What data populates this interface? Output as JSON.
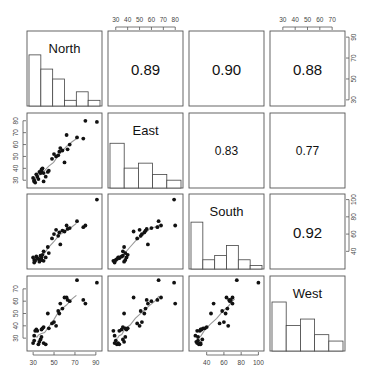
{
  "chart_data": {
    "type": "scatter",
    "title": "",
    "subtitle": "Scatterplot matrix (pairs plot) with histograms on diagonal, LOWESS smoothers in lower panels, correlation coefficients in upper panels",
    "variables": [
      "North",
      "East",
      "South",
      "West"
    ],
    "axis_ticks": {
      "North": [
        30,
        50,
        70,
        90
      ],
      "East": [
        30,
        40,
        50,
        60,
        70,
        80
      ],
      "South": [
        40,
        60,
        80,
        100
      ],
      "West": [
        30,
        40,
        50,
        60,
        70
      ]
    },
    "axis_ranges": {
      "North": [
        27,
        93
      ],
      "East": [
        26,
        84
      ],
      "South": [
        23,
        103
      ],
      "West": [
        22,
        78
      ]
    },
    "correlations": [
      {
        "pair": [
          "North",
          "East"
        ],
        "r": "0.89"
      },
      {
        "pair": [
          "North",
          "South"
        ],
        "r": "0.90"
      },
      {
        "pair": [
          "North",
          "West"
        ],
        "r": "0.88"
      },
      {
        "pair": [
          "East",
          "South"
        ],
        "r": "0.83"
      },
      {
        "pair": [
          "East",
          "West"
        ],
        "r": "0.77"
      },
      {
        "pair": [
          "South",
          "West"
        ],
        "r": "0.92"
      }
    ],
    "histograms": {
      "North": [
        0.72,
        0.52,
        0.38,
        0.08,
        0.2,
        0.08
      ],
      "East": [
        0.63,
        0.28,
        0.35,
        0.19,
        0.11
      ],
      "South": [
        0.66,
        0.13,
        0.19,
        0.33,
        0.13,
        0.05
      ],
      "West": [
        0.69,
        0.36,
        0.45,
        0.23,
        0.14
      ]
    },
    "observations": {
      "North": [
        30,
        31,
        31,
        32,
        33,
        34,
        35,
        36,
        37,
        38,
        38,
        39,
        40,
        40,
        42,
        44,
        45,
        48,
        50,
        52,
        54,
        55,
        56,
        58,
        60,
        62,
        63,
        65,
        72,
        78,
        80,
        91
      ],
      "East": [
        32,
        30,
        29,
        28,
        35,
        33,
        31,
        37,
        36,
        38,
        39,
        40,
        36,
        29,
        33,
        37,
        38,
        48,
        52,
        50,
        51,
        54,
        57,
        55,
        45,
        68,
        56,
        60,
        66,
        65,
        80,
        79
      ],
      "South": [
        33,
        30,
        27,
        29,
        34,
        32,
        31,
        28,
        35,
        30,
        33,
        36,
        40,
        29,
        33,
        45,
        38,
        55,
        60,
        65,
        58,
        62,
        48,
        64,
        63,
        70,
        66,
        67,
        75,
        68,
        70,
        100
      ],
      "West": [
        26,
        28,
        32,
        36,
        37,
        36,
        25,
        27,
        29,
        31,
        37,
        38,
        39,
        26,
        25,
        50,
        38,
        42,
        43,
        40,
        52,
        50,
        58,
        54,
        63,
        63,
        61,
        60,
        77,
        61,
        58,
        75
      ]
    },
    "smoother_color": "#999999",
    "point_color": "#111111",
    "legend": null,
    "grid": false
  }
}
